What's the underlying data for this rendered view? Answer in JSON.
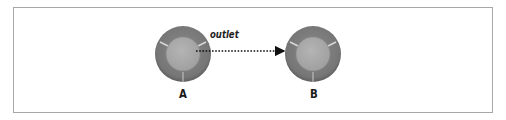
{
  "diagram": {
    "nodes": [
      {
        "id": "A",
        "label": "A"
      },
      {
        "id": "B",
        "label": "B"
      }
    ],
    "edges": [
      {
        "from": "A",
        "to": "B",
        "label": "outlet",
        "style": "dotted-arrow"
      }
    ],
    "colors": {
      "outer_ring": "#7a7a7a",
      "inner_core": "#a9a9a9",
      "divider": "#d8d8d8",
      "border": "#a8a8a8",
      "arrow": "#111111"
    }
  }
}
